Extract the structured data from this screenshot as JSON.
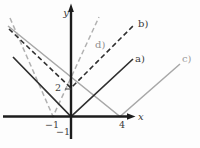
{
  "figure": {
    "kind": "math-plot",
    "background": "#fdfdfd"
  },
  "chart_data": {
    "type": "line",
    "title": "",
    "x_label": "x",
    "y_label": "y",
    "x_tick_labels": [
      "−1",
      "4"
    ],
    "y_tick_labels": [
      "2",
      "−1"
    ],
    "grid": false,
    "legend": "inline labels at right ends of lines",
    "series": [
      {
        "name": "a)",
        "shape": "absolute-value V",
        "vertex": [
          0,
          0
        ],
        "arm_slope": 1,
        "style": "solid",
        "tone": "dark"
      },
      {
        "name": "b)",
        "shape": "absolute-value V",
        "vertex": [
          0,
          2
        ],
        "arm_slope": 1,
        "style": "dashed",
        "tone": "dark"
      },
      {
        "name": "c)",
        "shape": "absolute-value V",
        "vertex": [
          4,
          0
        ],
        "arm_slope": 1,
        "style": "solid",
        "tone": "gray"
      },
      {
        "name": "d)",
        "shape": "absolute-value V",
        "vertex": [
          -1,
          0
        ],
        "arm_slope": 2,
        "style": "dashed",
        "tone": "gray"
      }
    ]
  },
  "render": {
    "canvas": {
      "w": 200,
      "h": 148
    },
    "axis_color": "#1c1c1c",
    "axis_width": 2.4,
    "x_axis": {
      "x1": 3,
      "y1": 116.5,
      "x2": 128.5,
      "y2": 116.5,
      "arrow": "127,113.3 135.5,116.5 127,119.7",
      "label": "x",
      "label_x": 138,
      "label_y": 119.5
    },
    "y_axis": {
      "x1": 71,
      "y1": 139,
      "x2": 71,
      "y2": 10,
      "arrow": "68.1,12 71,3.5 73.9,12",
      "label": "y",
      "label_x": 69,
      "label_y": 16
    },
    "ticks": [
      {
        "id": "tick-label-y2",
        "text": "2",
        "x": 61,
        "y": 91,
        "anchor": "end",
        "tick_line": [
          65,
          89,
          71.5,
          89
        ]
      },
      {
        "id": "tick-label-x-neg1",
        "text": "−1",
        "x": 52,
        "y": 128,
        "anchor": "middle"
      },
      {
        "id": "tick-label-x4",
        "text": "4",
        "x": 122,
        "y": 128,
        "anchor": "middle"
      },
      {
        "id": "tick-label-y-neg1",
        "text": "−1",
        "x": 70,
        "y": 135,
        "anchor": "end"
      }
    ],
    "tick_color": "#3a3a3a",
    "tick_font_size": 9.5,
    "label_font_size": 10,
    "series_px": [
      {
        "id": "c",
        "points": "8,26 120,116.5 180,64",
        "color": "#a8a8a8",
        "width": 1.5,
        "dash": "",
        "label": "c)",
        "label_x": 182,
        "label_y": 62,
        "label_color": "#9a9a9a"
      },
      {
        "id": "d",
        "points": "10,18 53,116.5 99,17",
        "color": "#b1b1b1",
        "width": 1.5,
        "dash": "5,3",
        "label": "d)",
        "label_x": 95,
        "label_y": 48,
        "label_color": "#8f8f8f"
      },
      {
        "id": "a",
        "points": "13,57 71,116.5 133,59",
        "color": "#2f2f2f",
        "width": 1.7,
        "dash": "",
        "label": "a)",
        "label_x": 135,
        "label_y": 62,
        "label_color": "#3a3a3a"
      },
      {
        "id": "b",
        "points": "9,29 71,88 133,26",
        "color": "#2f2f2f",
        "width": 1.6,
        "dash": "5,3",
        "label": "b)",
        "label_x": 138,
        "label_y": 27,
        "label_color": "#3a3a3a"
      }
    ]
  }
}
